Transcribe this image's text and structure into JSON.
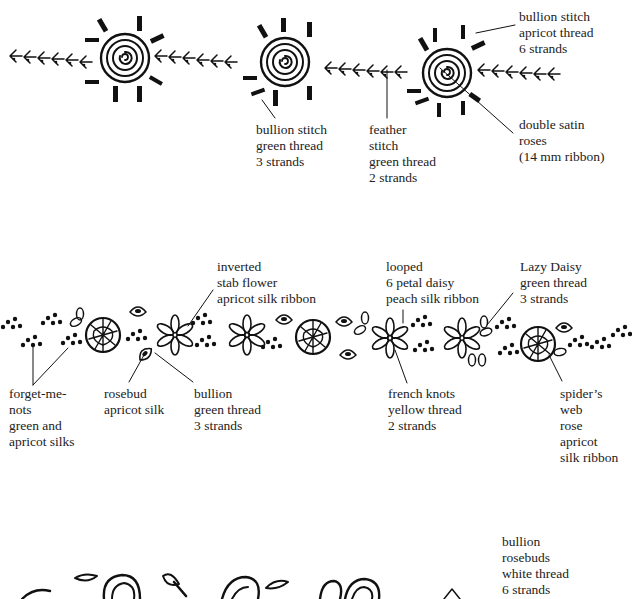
{
  "diagram": {
    "type": "embroidery-stitch-guide",
    "rows": [
      {
        "id": "row-1",
        "description": "feather stitch band with double satin roses",
        "labels": [
          {
            "id": "bullion-green",
            "lines": [
              "bullion stitch",
              "green thread",
              "3 strands"
            ]
          },
          {
            "id": "feather-stitch",
            "lines": [
              "feather",
              "stitch",
              "green thread",
              "2 strands"
            ]
          },
          {
            "id": "bullion-apricot",
            "lines": [
              "bullion stitch",
              "apricot thread",
              "6 strands"
            ]
          },
          {
            "id": "double-satin-roses",
            "lines": [
              "double satin",
              "roses",
              "(14 mm ribbon)"
            ]
          }
        ]
      },
      {
        "id": "row-2",
        "description": "mixed flower band",
        "labels": [
          {
            "id": "inverted-stab-flower",
            "lines": [
              "inverted",
              "stab flower",
              "apricot silk ribbon"
            ]
          },
          {
            "id": "looped-daisy",
            "lines": [
              "looped",
              "6 petal daisy",
              "peach silk ribbon"
            ]
          },
          {
            "id": "lazy-daisy",
            "lines": [
              "Lazy Daisy",
              "green thread",
              "3 strands"
            ]
          },
          {
            "id": "forget-me-nots",
            "lines": [
              "forget-me-",
              "nots",
              "green and",
              "apricot silks"
            ]
          },
          {
            "id": "rosebud",
            "lines": [
              "rosebud",
              "apricot silk"
            ]
          },
          {
            "id": "bullion-green-2",
            "lines": [
              "bullion",
              "green thread",
              "3 strands"
            ]
          },
          {
            "id": "french-knots",
            "lines": [
              "french knots",
              "yellow thread",
              "2 strands"
            ]
          },
          {
            "id": "spiders-web-rose",
            "lines": [
              "spider’s",
              "web",
              "rose",
              "apricot",
              "silk ribbon"
            ]
          }
        ]
      },
      {
        "id": "row-3",
        "description": "bullion rosebud band (partially visible)",
        "labels": [
          {
            "id": "bullion-rosebuds",
            "lines": [
              "bullion",
              "rosebuds",
              "white thread",
              "6 strands"
            ]
          }
        ]
      }
    ]
  },
  "colors": {
    "ink": "#111111",
    "background": "#ffffff",
    "text": "#222222"
  }
}
